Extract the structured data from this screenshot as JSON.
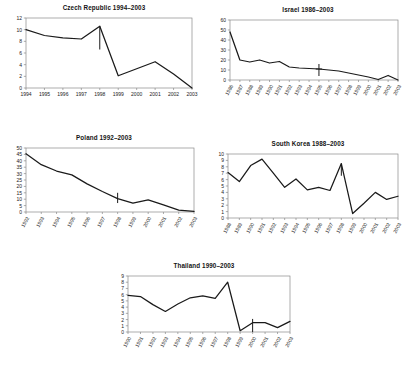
{
  "figure": {
    "background_color": "#ffffff",
    "line_color": "#1a1a1a",
    "axis_color": "#8a8a8a",
    "panel_count": 5
  },
  "chart_data": [
    {
      "id": "czech",
      "type": "line",
      "title": "Czech Republic 1994–2003",
      "xlabel": "",
      "ylabel": "",
      "grid": false,
      "legend": "none",
      "label_orientation": "horizontal",
      "ylim": [
        0,
        12
      ],
      "yticks": [
        0,
        2,
        4,
        6,
        8,
        10,
        12
      ],
      "categories": [
        "1994",
        "1995",
        "1996",
        "1997",
        "1998",
        "1999",
        "2000",
        "2001",
        "2002",
        "2003"
      ],
      "values": [
        10.0,
        9.0,
        8.6,
        8.4,
        10.6,
        2.1,
        3.3,
        4.5,
        2.4,
        0.0
      ],
      "annotations": [
        {
          "type": "vertical-tick",
          "x": "1998",
          "y_top": 10.6,
          "y_bottom": 6.6
        }
      ]
    },
    {
      "id": "israel",
      "type": "line",
      "title": "Israel 1986–2003",
      "xlabel": "",
      "ylabel": "",
      "grid": false,
      "legend": "none",
      "label_orientation": "rotated",
      "ylim": [
        0,
        60
      ],
      "yticks": [
        0,
        10,
        20,
        30,
        40,
        50,
        60
      ],
      "categories": [
        "1986",
        "1987",
        "1988",
        "1989",
        "1990",
        "1991",
        "1992",
        "1993",
        "1994",
        "1995",
        "1996",
        "1997",
        "1998",
        "1999",
        "2000",
        "2001",
        "2002",
        "2003"
      ],
      "values": [
        48.0,
        20.0,
        18.0,
        20.0,
        17.0,
        18.5,
        13.0,
        12.0,
        11.5,
        11.0,
        10.0,
        9.0,
        7.0,
        5.0,
        3.0,
        0.5,
        4.5,
        0.0
      ],
      "annotations": [
        {
          "type": "plus-marker",
          "x": "1995",
          "y": 11.0,
          "y_top": 16.0,
          "y_bottom": 4.0
        }
      ]
    },
    {
      "id": "poland",
      "type": "line",
      "title": "Poland 1992–2003",
      "xlabel": "",
      "ylabel": "",
      "grid": false,
      "legend": "none",
      "label_orientation": "rotated",
      "ylim": [
        0,
        50
      ],
      "yticks": [
        0,
        5,
        10,
        15,
        20,
        25,
        30,
        35,
        40,
        45,
        50
      ],
      "categories": [
        "1992",
        "1993",
        "1994",
        "1995",
        "1996",
        "1997",
        "1998",
        "1999",
        "2000",
        "2001",
        "2002",
        "2003"
      ],
      "values": [
        45.5,
        37.0,
        32.0,
        29.0,
        22.0,
        16.0,
        10.5,
        7.0,
        9.5,
        5.5,
        1.5,
        0.5
      ],
      "annotations": [
        {
          "type": "vertical-tick",
          "x": "1998",
          "y_top": 15.0,
          "y_bottom": 7.0
        }
      ]
    },
    {
      "id": "south-korea",
      "type": "line",
      "title": "South Korea 1988–2003",
      "xlabel": "",
      "ylabel": "",
      "grid": false,
      "legend": "none",
      "label_orientation": "rotated",
      "ylim": [
        0,
        10
      ],
      "yticks": [
        0,
        1,
        2,
        3,
        4,
        5,
        6,
        7,
        8,
        9,
        10
      ],
      "categories": [
        "1988",
        "1989",
        "1990",
        "1991",
        "1992",
        "1993",
        "1994",
        "1995",
        "1996",
        "1997",
        "1998",
        "1999",
        "2000",
        "2001",
        "2002",
        "2003"
      ],
      "values": [
        7.1,
        5.7,
        8.2,
        9.2,
        7.0,
        4.8,
        6.1,
        4.4,
        4.8,
        4.3,
        8.5,
        0.7,
        2.3,
        4.0,
        2.9,
        3.4
      ],
      "annotations": [
        {
          "type": "vertical-tick",
          "x": "1998",
          "y_top": 8.5,
          "y_bottom": 6.6
        }
      ]
    },
    {
      "id": "thailand",
      "type": "line",
      "title": "Thailand 1990–2003",
      "xlabel": "",
      "ylabel": "",
      "grid": false,
      "legend": "none",
      "label_orientation": "rotated",
      "ylim": [
        0,
        9
      ],
      "yticks": [
        0,
        1,
        2,
        3,
        4,
        5,
        6,
        7,
        8,
        9
      ],
      "categories": [
        "1990",
        "1991",
        "1992",
        "1993",
        "1994",
        "1995",
        "1996",
        "1997",
        "1998",
        "1999",
        "2000",
        "2001",
        "2002",
        "2003"
      ],
      "values": [
        5.9,
        5.7,
        4.4,
        3.3,
        4.5,
        5.5,
        5.8,
        5.4,
        8.0,
        0.2,
        1.5,
        1.5,
        0.7,
        1.7
      ],
      "annotations": [
        {
          "type": "vertical-tick",
          "x": "2000",
          "y_top": 2.1,
          "y_bottom": 0.0
        }
      ]
    }
  ]
}
